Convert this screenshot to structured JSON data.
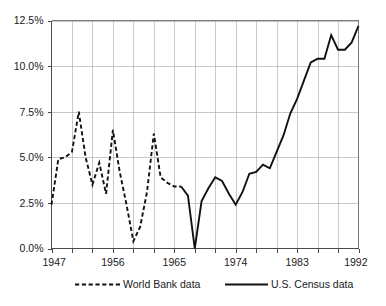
{
  "chart_data": {
    "type": "line",
    "title": "",
    "subtitle": "",
    "xlabel": "",
    "ylabel": "",
    "xlim": [
      1947,
      1992
    ],
    "ylim": [
      0,
      12.5
    ],
    "grid": true,
    "legend_position": "bottom",
    "y_ticks": [
      "0.0%",
      "2.5%",
      "5.0%",
      "7.5%",
      "10.0%",
      "12.5%"
    ],
    "y_tick_values": [
      0,
      2.5,
      5,
      7.5,
      10,
      12.5
    ],
    "x_ticks": [
      "1947",
      "1956",
      "1965",
      "1974",
      "1983",
      "1992"
    ],
    "x_tick_values": [
      1947,
      1956,
      1965,
      1974,
      1983,
      1992
    ],
    "x_minor_step": 3,
    "series": [
      {
        "name": "World Bank data",
        "style": "dashed",
        "color": "#111111",
        "x": [
          1947,
          1948,
          1949,
          1950,
          1951,
          1952,
          1953,
          1954,
          1955,
          1956,
          1957,
          1958,
          1959,
          1960,
          1961,
          1962,
          1963,
          1964,
          1965,
          1966
        ],
        "values": [
          2.4,
          4.9,
          5.0,
          5.3,
          7.5,
          5.0,
          3.5,
          4.7,
          3.0,
          6.5,
          4.2,
          2.4,
          0.4,
          1.2,
          3.1,
          6.3,
          3.9,
          3.6,
          3.4,
          3.4
        ]
      },
      {
        "name": "U.S. Census data",
        "style": "solid",
        "color": "#111111",
        "x": [
          1966,
          1967,
          1968,
          1969,
          1970,
          1971,
          1972,
          1973,
          1974,
          1975,
          1976,
          1977,
          1978,
          1979,
          1980,
          1981,
          1982,
          1983,
          1984,
          1985,
          1986,
          1987,
          1988,
          1989,
          1990,
          1991,
          1992
        ],
        "values": [
          3.4,
          2.9,
          0.0,
          2.6,
          3.3,
          3.9,
          3.7,
          3.0,
          2.4,
          3.1,
          4.1,
          4.2,
          4.6,
          4.4,
          5.3,
          6.2,
          7.4,
          8.2,
          9.2,
          10.2,
          10.4,
          10.4,
          11.7,
          10.9,
          10.9,
          11.3,
          12.2
        ]
      }
    ],
    "legend": [
      {
        "label": "World Bank data",
        "style": "dashed"
      },
      {
        "label": "U.S. Census data",
        "style": "solid"
      }
    ]
  },
  "colors": {
    "background": "#ffffff",
    "line": "#111111",
    "grid": "#b0b0b0",
    "frame": "#6e6e6e",
    "text": "#1a1a1a"
  }
}
